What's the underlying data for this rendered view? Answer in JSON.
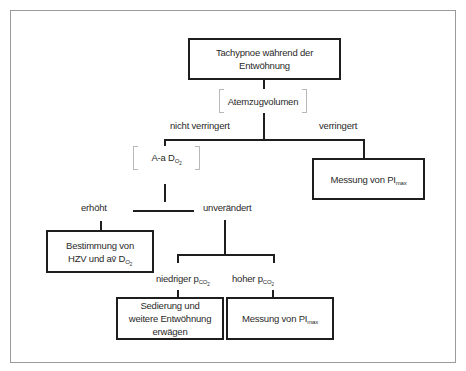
{
  "diagram": {
    "root": {
      "label": "Tachypnoe während der Entwöhnung"
    },
    "test1": {
      "label": "Atemzugvolumen"
    },
    "branch1": {
      "left_label": "nicht verringert",
      "right_label": "verringert",
      "right_result": {
        "text": "Messung von PI",
        "sub": "max"
      }
    },
    "test2": {
      "text": "A-a D",
      "sub": "O",
      "subsub": "2"
    },
    "branch2": {
      "left_label": "erhöht",
      "right_label": "unverändert",
      "left_result": {
        "line1": "Bestimmung von",
        "line2_text": "HZV und av̄ D",
        "line2_sub": "O",
        "line2_subsub": "2"
      }
    },
    "branch3": {
      "left_label_text": "niedriger p",
      "left_label_sub": "CO",
      "left_label_subsub": "2",
      "right_label_text": "hoher p",
      "right_label_sub": "CO",
      "right_label_subsub": "2",
      "left_result": {
        "line1": "Sedierung und",
        "line2": "weitere Entwöhnung",
        "line3": "erwägen"
      },
      "right_result": {
        "text": "Messung von PI",
        "sub": "max"
      }
    }
  }
}
